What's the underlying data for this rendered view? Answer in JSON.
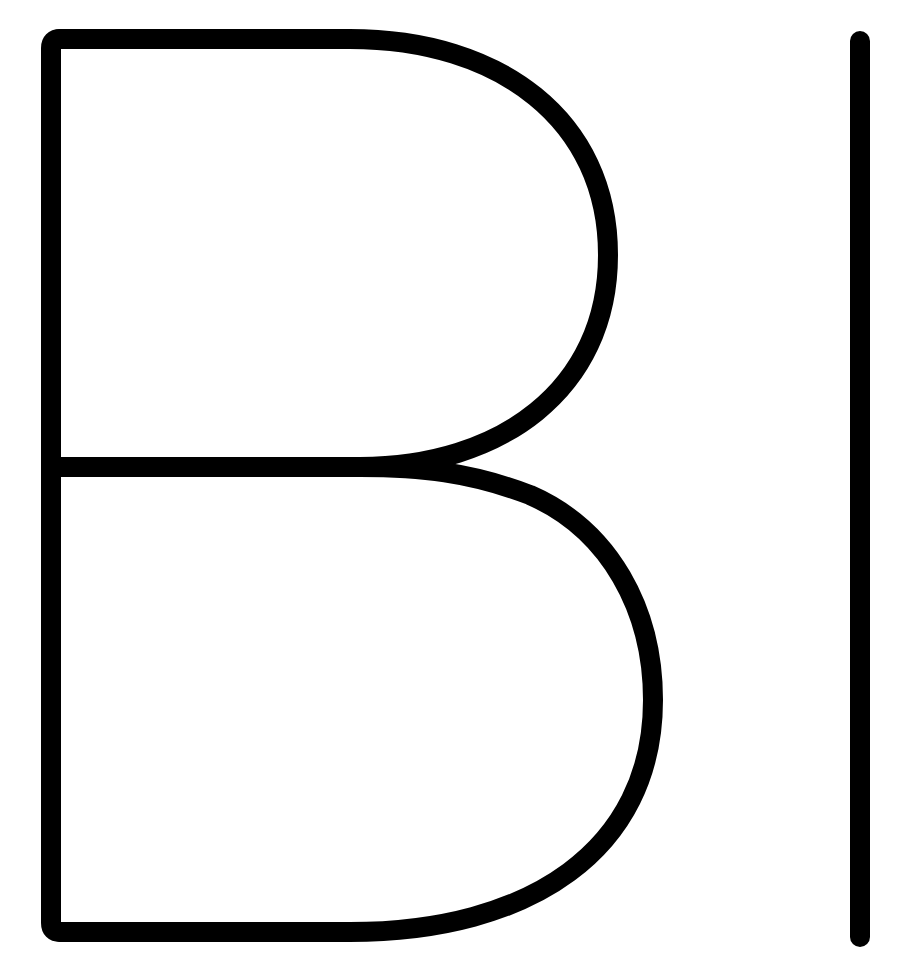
{
  "logo": {
    "text": "BI",
    "letters": [
      "B",
      "I"
    ],
    "stroke_color": "#000000",
    "background_color": "#ffffff",
    "stroke_width": 20
  }
}
